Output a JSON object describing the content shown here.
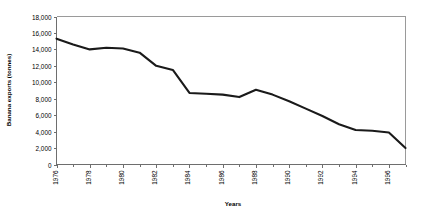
{
  "chart_data": {
    "type": "line",
    "title": "",
    "xlabel": "Years",
    "ylabel": "Banana exports (tonnes)",
    "ylim": [
      0,
      18000
    ],
    "ytick_step": 2000,
    "ytick_labels": [
      "18,000",
      "16,000",
      "14,000",
      "12,000",
      "10,000",
      "8,000",
      "6,000",
      "4,000",
      "2,000",
      "0"
    ],
    "ytick_values": [
      18000,
      16000,
      14000,
      12000,
      10000,
      8000,
      6000,
      4000,
      2000,
      0
    ],
    "xlim": [
      1976,
      1997
    ],
    "xtick_labels": [
      "1976",
      "1978",
      "1980",
      "1982",
      "1984",
      "1986",
      "1988",
      "1990",
      "1992",
      "1994",
      "1996"
    ],
    "xtick_values": [
      1976,
      1978,
      1980,
      1982,
      1984,
      1986,
      1988,
      1990,
      1992,
      1994,
      1996
    ],
    "minor_xticks": [
      1977,
      1979,
      1981,
      1983,
      1985,
      1987,
      1989,
      1991,
      1993,
      1995,
      1997
    ],
    "grid": false,
    "legend": false,
    "series": [
      {
        "name": "Banana exports",
        "color": "#1a1a1a",
        "x": [
          1976,
          1977,
          1978,
          1979,
          1980,
          1981,
          1982,
          1983,
          1984,
          1985,
          1986,
          1987,
          1988,
          1989,
          1990,
          1991,
          1992,
          1993,
          1994,
          1995,
          1996,
          1997
        ],
        "values": [
          15300,
          14600,
          14000,
          14200,
          14100,
          13600,
          12000,
          11500,
          8700,
          8600,
          8500,
          8200,
          9100,
          8500,
          7700,
          6800,
          5900,
          4900,
          4200,
          4100,
          3900,
          2000
        ]
      }
    ]
  }
}
